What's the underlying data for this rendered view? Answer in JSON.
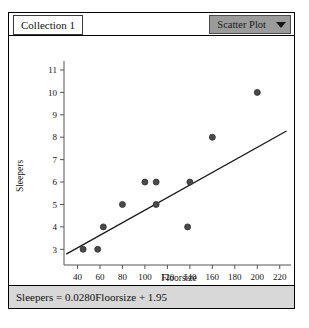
{
  "window": {
    "collection_tab_label": "Collection 1",
    "plot_type_label": "Scatter Plot",
    "caret_icon": "chevron-down-icon"
  },
  "equation": {
    "text": "Sleepers = 0.0280Floorsize + 1.95"
  },
  "chart_data": {
    "type": "scatter",
    "title": "",
    "xlabel": "Floorsize",
    "ylabel": "Sleepers",
    "xlim": [
      28,
      230
    ],
    "ylim": [
      2.3,
      11.4
    ],
    "xticks": [
      40,
      60,
      80,
      100,
      120,
      140,
      160,
      180,
      200,
      220
    ],
    "yticks": [
      3,
      4,
      5,
      6,
      7,
      8,
      9,
      10,
      11
    ],
    "grid": false,
    "legend": false,
    "point_color": "#4a4a4a",
    "line_color": "#1a1a1a",
    "points": [
      {
        "x": 45,
        "y": 3
      },
      {
        "x": 58,
        "y": 3
      },
      {
        "x": 63,
        "y": 4
      },
      {
        "x": 80,
        "y": 5
      },
      {
        "x": 100,
        "y": 6
      },
      {
        "x": 110,
        "y": 6
      },
      {
        "x": 110,
        "y": 5
      },
      {
        "x": 138,
        "y": 4
      },
      {
        "x": 140,
        "y": 6
      },
      {
        "x": 160,
        "y": 8
      },
      {
        "x": 200,
        "y": 10
      }
    ],
    "fit_line": {
      "slope": 0.028,
      "intercept": 1.95,
      "x_start": 30,
      "x_end": 226
    }
  }
}
